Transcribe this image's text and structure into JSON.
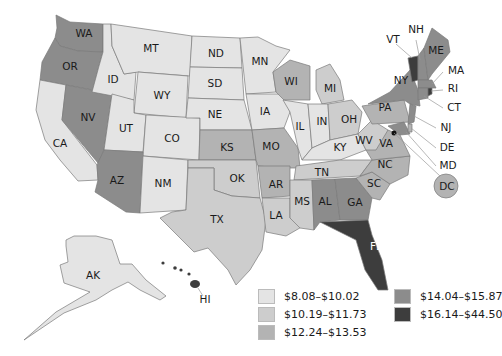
{
  "map": {
    "type": "choropleth",
    "region": "United States",
    "colors": {
      "c1": "#e4e4e4",
      "c2": "#cdcdcd",
      "c3": "#b3b3b3",
      "c4": "#8c8c8c",
      "c5": "#3d3d3d"
    },
    "legend": [
      {
        "range": "$8.08–$10.02",
        "color": "#e4e4e4"
      },
      {
        "range": "$10.19–$11.73",
        "color": "#cdcdcd"
      },
      {
        "range": "$12.24–$13.53",
        "color": "#b3b3b3"
      },
      {
        "range": "$14.04–$15.87",
        "color": "#8c8c8c"
      },
      {
        "range": "$16.14–$44.50",
        "color": "#3d3d3d"
      }
    ],
    "states": {
      "WA": {
        "label": "WA",
        "class": "$14.04–$15.87"
      },
      "OR": {
        "label": "OR",
        "class": "$14.04–$15.87"
      },
      "CA": {
        "label": "CA",
        "class": "$8.08–$10.02"
      },
      "NV": {
        "label": "NV",
        "class": "$14.04–$15.87"
      },
      "ID": {
        "label": "ID",
        "class": "$8.08–$10.02"
      },
      "MT": {
        "label": "MT",
        "class": "$8.08–$10.02"
      },
      "WY": {
        "label": "WY",
        "class": "$8.08–$10.02"
      },
      "UT": {
        "label": "UT",
        "class": "$8.08–$10.02"
      },
      "CO": {
        "label": "CO",
        "class": "$8.08–$10.02"
      },
      "AZ": {
        "label": "AZ",
        "class": "$14.04–$15.87"
      },
      "NM": {
        "label": "NM",
        "class": "$8.08–$10.02"
      },
      "ND": {
        "label": "ND",
        "class": "$8.08–$10.02"
      },
      "SD": {
        "label": "SD",
        "class": "$8.08–$10.02"
      },
      "NE": {
        "label": "NE",
        "class": "$8.08–$10.02"
      },
      "KS": {
        "label": "KS",
        "class": "$12.24–$13.53"
      },
      "OK": {
        "label": "OK",
        "class": "$10.19–$11.73"
      },
      "TX": {
        "label": "TX",
        "class": "$10.19–$11.73"
      },
      "MN": {
        "label": "MN",
        "class": "$8.08–$10.02"
      },
      "IA": {
        "label": "IA",
        "class": "$8.08–$10.02"
      },
      "MO": {
        "label": "MO",
        "class": "$12.24–$13.53"
      },
      "AR": {
        "label": "AR",
        "class": "$12.24–$13.53"
      },
      "LA": {
        "label": "LA",
        "class": "$10.19–$11.73"
      },
      "WI": {
        "label": "WI",
        "class": "$12.24–$13.53"
      },
      "IL": {
        "label": "IL",
        "class": "$8.08–$10.02"
      },
      "MI": {
        "label": "MI",
        "class": "$10.19–$11.73"
      },
      "IN": {
        "label": "IN",
        "class": "$8.08–$10.02"
      },
      "OH": {
        "label": "OH",
        "class": "$10.19–$11.73"
      },
      "KY": {
        "label": "KY",
        "class": "$8.08–$10.02"
      },
      "TN": {
        "label": "TN",
        "class": "$10.19–$11.73"
      },
      "MS": {
        "label": "MS",
        "class": "$10.19–$11.73"
      },
      "AL": {
        "label": "AL",
        "class": "$14.04–$15.87"
      },
      "GA": {
        "label": "GA",
        "class": "$14.04–$15.87"
      },
      "FL": {
        "label": "FL",
        "class": "$16.14–$44.50"
      },
      "SC": {
        "label": "SC",
        "class": "$12.24–$13.53"
      },
      "NC": {
        "label": "NC",
        "class": "$12.24–$13.53"
      },
      "VA": {
        "label": "VA",
        "class": "$12.24–$13.53"
      },
      "WV": {
        "label": "WV",
        "class": "$10.19–$11.73"
      },
      "PA": {
        "label": "PA",
        "class": "$12.24–$13.53"
      },
      "NY": {
        "label": "NY",
        "class": "$14.04–$15.87"
      },
      "VT": {
        "label": "VT",
        "class": "$16.14–$44.50"
      },
      "NH": {
        "label": "NH",
        "class": "$14.04–$15.87"
      },
      "ME": {
        "label": "ME",
        "class": "$14.04–$15.87"
      },
      "MA": {
        "label": "MA",
        "class": "$14.04–$15.87"
      },
      "RI": {
        "label": "RI",
        "class": "$16.14–$44.50"
      },
      "CT": {
        "label": "CT",
        "class": "$14.04–$15.87"
      },
      "NJ": {
        "label": "NJ",
        "class": "$14.04–$15.87"
      },
      "DE": {
        "label": "DE",
        "class": "$12.24–$13.53"
      },
      "MD": {
        "label": "MD",
        "class": "$14.04–$15.87"
      },
      "DC": {
        "label": "DC",
        "class": "$12.24–$13.53"
      },
      "AK": {
        "label": "AK",
        "class": "$8.08–$10.02"
      },
      "HI": {
        "label": "HI",
        "class": "$16.14–$44.50"
      }
    }
  }
}
